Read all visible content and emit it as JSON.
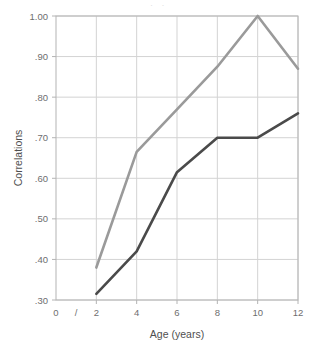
{
  "chart_data": {
    "type": "line",
    "title": "",
    "xlabel": "Age (years)",
    "ylabel": "Correlations",
    "x": [
      2,
      4,
      6,
      8,
      10,
      12
    ],
    "xticks": [
      "0",
      "2",
      "4",
      "6",
      "8",
      "10",
      "12"
    ],
    "xtick_values": [
      0,
      2,
      4,
      6,
      8,
      10,
      12
    ],
    "xlim": [
      0,
      12
    ],
    "yticks": [
      "1.00",
      ".90",
      ".80",
      ".70",
      ".60",
      ".50",
      ".40",
      ".30"
    ],
    "ytick_values": [
      1.0,
      0.9,
      0.8,
      0.7,
      0.6,
      0.5,
      0.4,
      0.3
    ],
    "ylim": [
      0.3,
      1.0
    ],
    "grid": true,
    "legend": "none",
    "axis_break": {
      "present": true,
      "symbol": "/",
      "between": [
        0,
        2
      ]
    },
    "series": [
      {
        "name": "upper",
        "color": "#9a9a9a",
        "values": [
          0.38,
          0.665,
          0.77,
          0.875,
          1.0,
          0.87
        ]
      },
      {
        "name": "lower",
        "color": "#4a4a4a",
        "values": [
          0.315,
          0.42,
          0.615,
          0.7,
          0.7,
          0.76
        ]
      }
    ]
  },
  "colors": {
    "upper_line": "#9a9a9a",
    "lower_line": "#4a4a4a",
    "grid": "#d3d3d3",
    "axis": "#b4b4b4",
    "tick_text": "#6e6e6e",
    "axis_title": "#4f4f4f",
    "background": "#ffffff"
  },
  "title_remnant": "· ·"
}
